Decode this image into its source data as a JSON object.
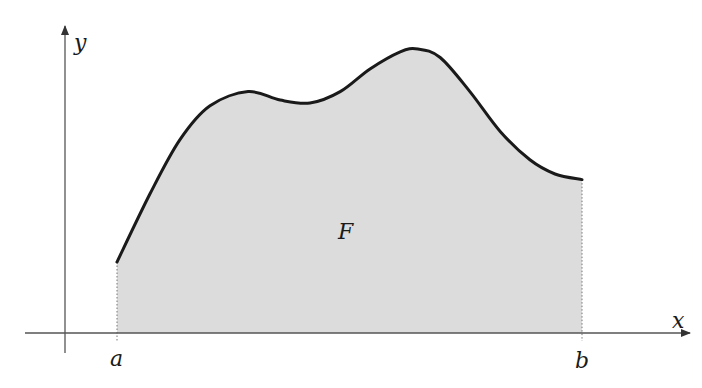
{
  "diagram": {
    "type": "area-under-curve",
    "labels": {
      "x_axis": "x",
      "y_axis": "y",
      "lower_bound": "a",
      "upper_bound": "b",
      "area": "F"
    },
    "colors": {
      "curve": "#1a1a1a",
      "fill": "#dcdcdc",
      "axis": "#555555",
      "bound_lines": "#777777"
    },
    "curve_points": [
      [
        0.0,
        0.25
      ],
      [
        0.071,
        0.49
      ],
      [
        0.135,
        0.68
      ],
      [
        0.2,
        0.8
      ],
      [
        0.282,
        0.85
      ],
      [
        0.351,
        0.82
      ],
      [
        0.415,
        0.81
      ],
      [
        0.48,
        0.85
      ],
      [
        0.544,
        0.93
      ],
      [
        0.609,
        0.99
      ],
      [
        0.647,
        1.0
      ],
      [
        0.695,
        0.97
      ],
      [
        0.759,
        0.85
      ],
      [
        0.824,
        0.71
      ],
      [
        0.888,
        0.61
      ],
      [
        0.942,
        0.56
      ],
      [
        1.0,
        0.54
      ]
    ]
  }
}
